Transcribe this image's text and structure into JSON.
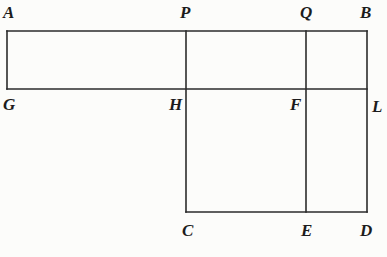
{
  "figure": {
    "stroke_color": "#2b2b2b",
    "background_color": "#fcfcfa",
    "stroke_width": 1.6,
    "labels": {
      "A": "A",
      "P": "P",
      "Q": "Q",
      "B": "B",
      "G": "G",
      "H": "H",
      "F": "F",
      "L": "L",
      "C": "C",
      "E": "E",
      "D": "D"
    }
  },
  "chart_data": {
    "type": "diagram",
    "xlabel": "",
    "ylabel": "",
    "xlim": [
      0,
      387
    ],
    "ylim": [
      0,
      257
    ],
    "grid": false,
    "legend": null,
    "points": [
      {
        "name": "A",
        "x": 7,
        "y": 31,
        "label_x": 3,
        "label_y": 4
      },
      {
        "name": "P",
        "x": 186,
        "y": 31,
        "label_x": 180,
        "label_y": 4
      },
      {
        "name": "Q",
        "x": 306,
        "y": 31,
        "label_x": 300,
        "label_y": 4
      },
      {
        "name": "B",
        "x": 367,
        "y": 31,
        "label_x": 360,
        "label_y": 4
      },
      {
        "name": "G",
        "x": 7,
        "y": 89,
        "label_x": 3,
        "label_y": 96
      },
      {
        "name": "H",
        "x": 186,
        "y": 89,
        "label_x": 169,
        "label_y": 96
      },
      {
        "name": "F",
        "x": 306,
        "y": 89,
        "label_x": 290,
        "label_y": 96
      },
      {
        "name": "L",
        "x": 367,
        "y": 89,
        "label_x": 372,
        "label_y": 98
      },
      {
        "name": "C",
        "x": 186,
        "y": 212,
        "label_x": 182,
        "label_y": 222
      },
      {
        "name": "E",
        "x": 306,
        "y": 212,
        "label_x": 301,
        "label_y": 222
      },
      {
        "name": "D",
        "x": 367,
        "y": 212,
        "label_x": 360,
        "label_y": 222
      }
    ],
    "segments": [
      {
        "name": "AB-top-edge",
        "x1": 7,
        "y1": 31,
        "x2": 367,
        "y2": 31
      },
      {
        "name": "GL-middle-edge",
        "x1": 7,
        "y1": 89,
        "x2": 367,
        "y2": 89
      },
      {
        "name": "CD-bottom-edge",
        "x1": 186,
        "y1": 212,
        "x2": 367,
        "y2": 212
      },
      {
        "name": "AG-left-edge",
        "x1": 7,
        "y1": 31,
        "x2": 7,
        "y2": 89
      },
      {
        "name": "PC-vertical",
        "x1": 186,
        "y1": 31,
        "x2": 186,
        "y2": 212
      },
      {
        "name": "QE-vertical",
        "x1": 306,
        "y1": 31,
        "x2": 306,
        "y2": 212
      },
      {
        "name": "BD-right-edge",
        "x1": 367,
        "y1": 31,
        "x2": 367,
        "y2": 212
      }
    ]
  }
}
